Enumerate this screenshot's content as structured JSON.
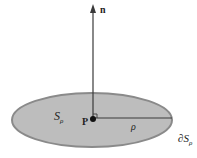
{
  "diagram": {
    "normal_label": "n",
    "point_label": "P",
    "surface_label": "S",
    "surface_subscript": "ρ",
    "radius_label": "ρ",
    "boundary_label_prefix": "∂S",
    "boundary_subscript": "ρ",
    "colors": {
      "disk_fill": "#bdbdbd",
      "disk_stroke": "#8a8a8a",
      "lines": "#3a3a3a",
      "text": "#222222"
    }
  }
}
